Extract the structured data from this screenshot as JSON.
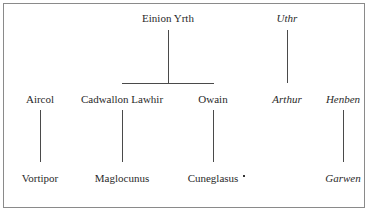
{
  "diagram": {
    "type": "family-tree",
    "generation_1": [
      {
        "id": "einion",
        "label": "Einion Yrth",
        "italic": false
      },
      {
        "id": "uthr",
        "label": "Uthr",
        "italic": true
      }
    ],
    "generation_2": [
      {
        "id": "aircol",
        "label": "Aircol",
        "italic": false
      },
      {
        "id": "cadwallon",
        "label": "Cadwallon Lawhir",
        "italic": false,
        "parent": "einion"
      },
      {
        "id": "owain",
        "label": "Owain",
        "italic": false,
        "parent": "einion"
      },
      {
        "id": "arthur",
        "label": "Arthur",
        "italic": true,
        "parent": "uthr"
      },
      {
        "id": "henben",
        "label": "Henben",
        "italic": true
      }
    ],
    "generation_3": [
      {
        "id": "vortipor",
        "label": "Vortipor",
        "italic": false,
        "parent": "aircol"
      },
      {
        "id": "maglocunus",
        "label": "Maglocunus",
        "italic": false,
        "parent": "cadwallon"
      },
      {
        "id": "cuneglasus",
        "label": "Cuneglasus",
        "italic": false,
        "parent": "owain",
        "marker": "•"
      },
      {
        "id": "garwen",
        "label": "Garwen",
        "italic": true,
        "parent": "henben"
      }
    ]
  }
}
